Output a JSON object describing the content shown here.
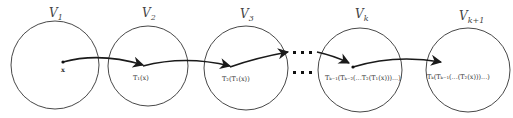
{
  "diagram": {
    "spaces": [
      {
        "id": "v1",
        "label": "V",
        "subscript": "1",
        "cx": 55,
        "cy": 65,
        "r": 44,
        "lx": 50,
        "ly": 17
      },
      {
        "id": "v2",
        "label": "V",
        "subscript": "2",
        "cx": 148,
        "cy": 66,
        "r": 40,
        "lx": 143,
        "ly": 17
      },
      {
        "id": "v3",
        "label": "V",
        "subscript": "3",
        "cx": 246,
        "cy": 68,
        "r": 42,
        "lx": 241,
        "ly": 18
      },
      {
        "id": "vk",
        "label": "V",
        "subscript": "k",
        "cx": 360,
        "cy": 70,
        "r": 42,
        "lx": 356,
        "ly": 18
      },
      {
        "id": "vk1",
        "label": "V",
        "subscript": "k+1",
        "cx": 468,
        "cy": 70,
        "r": 42,
        "lx": 460,
        "ly": 20
      }
    ],
    "points": [
      {
        "id": "x",
        "label": "x",
        "x": 63,
        "y": 62
      },
      {
        "id": "t1",
        "label": "T₁(x)",
        "x": 143,
        "y": 66
      },
      {
        "id": "t2",
        "label": "T₂(T₁(x))",
        "x": 230,
        "y": 67
      },
      {
        "id": "tk1",
        "label": "Tₖ₋₁(Tₖ₋₂(...T₂(T₁(x)))...)",
        "x": 353,
        "y": 67
      },
      {
        "id": "tk",
        "label": "Tₖ(Tₖ₋₁(...(T₂(x)))...)",
        "x": 471,
        "y": 67
      }
    ],
    "labels": {
      "x": "x",
      "t1": "T₁(x)",
      "t2": "T₂(T₁(x))",
      "tk1": "Tₖ₋₁(Tₖ₋₂(...T₂(T₁(x)))...)",
      "tk": "Tₖ(Tₖ₋₁(...(T₂(x)))...)",
      "v1_main": "V",
      "v1_sub": "1",
      "v2_main": "V",
      "v2_sub": "2",
      "v3_main": "V",
      "v3_sub": "3",
      "vk_main": "V",
      "vk_sub": "k",
      "vk1_main": "V",
      "vk1_sub": "k+1"
    },
    "ellipsis": {
      "rows": 2,
      "dots_per_row": 3
    },
    "mappings": [
      {
        "from": "x",
        "to": "t1",
        "label": "T1"
      },
      {
        "from": "t1",
        "to": "t2",
        "label": "T2"
      },
      {
        "from": "t2",
        "to": "ellipsis",
        "label": ""
      },
      {
        "from": "ellipsis",
        "to": "tk1",
        "label": ""
      },
      {
        "from": "tk1",
        "to": "tk",
        "label": "Tk"
      }
    ]
  }
}
